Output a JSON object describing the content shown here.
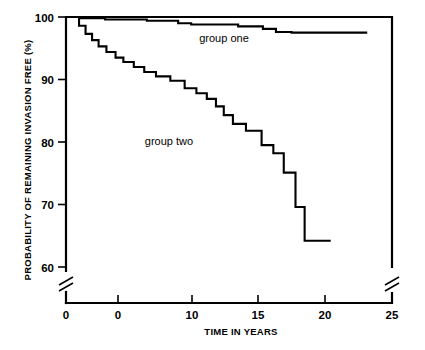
{
  "chart_data": {
    "type": "line",
    "title": "",
    "xlabel": "TIME IN YEARS",
    "ylabel": "PROBABILITY OF REMAINING INVASION FREE (%)",
    "xlim": [
      0,
      25
    ],
    "ylim": [
      60,
      100
    ],
    "grid": false,
    "legend_position": "inline-annotations",
    "x_ticks": [
      0,
      5,
      10,
      15,
      20,
      25
    ],
    "x_tick_labels": [
      "0",
      "0",
      "10",
      "15",
      "20",
      "25"
    ],
    "y_ticks": [
      60,
      70,
      80,
      90,
      100
    ],
    "y_tick_labels": [
      "60",
      "70",
      "80",
      "90",
      "100"
    ],
    "axis_breaks": {
      "y_axis_break_below": 60,
      "right_axis_break_below": 60
    },
    "annotations": [
      {
        "text": "group one",
        "x": 11.4,
        "y": 97.8
      },
      {
        "text": "group two",
        "x": 7.4,
        "y": 80.5
      }
    ],
    "series": [
      {
        "name": "group one",
        "style": "step",
        "points": [
          [
            0.0,
            100.0
          ],
          [
            1.1,
            100.0
          ],
          [
            1.1,
            99.8
          ],
          [
            3.0,
            99.8
          ],
          [
            3.0,
            99.6
          ],
          [
            6.2,
            99.6
          ],
          [
            6.2,
            99.4
          ],
          [
            8.6,
            99.4
          ],
          [
            8.6,
            99.0
          ],
          [
            9.6,
            99.0
          ],
          [
            9.6,
            98.8
          ],
          [
            13.2,
            98.8
          ],
          [
            13.2,
            98.5
          ],
          [
            15.1,
            98.5
          ],
          [
            15.1,
            98.1
          ],
          [
            16.1,
            98.1
          ],
          [
            16.1,
            97.6
          ],
          [
            17.3,
            97.6
          ],
          [
            17.3,
            97.5
          ],
          [
            23.1,
            97.5
          ]
        ]
      },
      {
        "name": "group two",
        "style": "step",
        "points": [
          [
            0.0,
            100.0
          ],
          [
            1.0,
            100.0
          ],
          [
            1.0,
            98.6
          ],
          [
            1.5,
            98.6
          ],
          [
            1.5,
            97.3
          ],
          [
            2.0,
            97.3
          ],
          [
            2.0,
            96.3
          ],
          [
            2.5,
            96.3
          ],
          [
            2.5,
            95.3
          ],
          [
            3.1,
            95.3
          ],
          [
            3.1,
            94.4
          ],
          [
            3.8,
            94.4
          ],
          [
            3.8,
            93.5
          ],
          [
            4.4,
            93.5
          ],
          [
            4.4,
            92.8
          ],
          [
            5.2,
            92.8
          ],
          [
            5.2,
            92.0
          ],
          [
            6.0,
            92.0
          ],
          [
            6.0,
            91.2
          ],
          [
            6.9,
            91.2
          ],
          [
            6.9,
            90.5
          ],
          [
            8.0,
            90.5
          ],
          [
            8.0,
            89.8
          ],
          [
            9.1,
            89.8
          ],
          [
            9.1,
            88.6
          ],
          [
            10.0,
            88.6
          ],
          [
            10.0,
            87.8
          ],
          [
            10.8,
            87.8
          ],
          [
            10.8,
            86.9
          ],
          [
            11.5,
            86.9
          ],
          [
            11.5,
            85.7
          ],
          [
            12.1,
            85.7
          ],
          [
            12.1,
            84.3
          ],
          [
            12.8,
            84.3
          ],
          [
            12.8,
            82.9
          ],
          [
            13.8,
            82.9
          ],
          [
            13.8,
            81.8
          ],
          [
            15.0,
            81.8
          ],
          [
            15.0,
            79.5
          ],
          [
            15.9,
            79.5
          ],
          [
            15.9,
            78.2
          ],
          [
            16.7,
            78.2
          ],
          [
            16.7,
            75.1
          ],
          [
            17.6,
            75.1
          ],
          [
            17.6,
            69.6
          ],
          [
            18.3,
            69.6
          ],
          [
            18.3,
            64.2
          ],
          [
            20.3,
            64.2
          ]
        ]
      }
    ]
  },
  "figure": {
    "alt": "Kaplan-Meier style step plot comparing group one and group two"
  }
}
